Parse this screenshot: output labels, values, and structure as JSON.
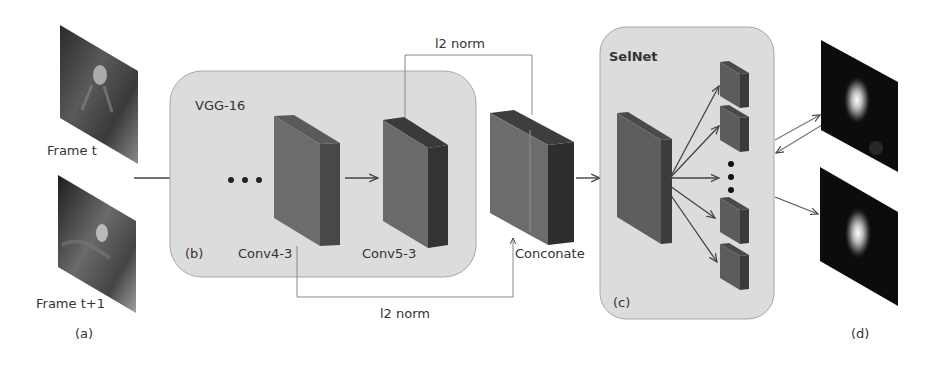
{
  "panels": {
    "a": {
      "label": "(a)",
      "frames": [
        {
          "label": "Frame t"
        },
        {
          "label": "Frame t+1"
        }
      ]
    },
    "b": {
      "title": "VGG-16",
      "label": "(b)",
      "ellipsis": "• • •",
      "layers": [
        {
          "label": "Conv4-3"
        },
        {
          "label": "Conv5-3"
        }
      ]
    },
    "concat": {
      "label": "Conconate",
      "top_connection_label": "l2 norm",
      "bottom_connection_label": "l2 norm"
    },
    "c": {
      "title": "SelNet",
      "label": "(c)",
      "output_blocks_visible": 4,
      "ellipsis": "⋮"
    },
    "d": {
      "label": "(d)",
      "maps": 2
    }
  },
  "colors": {
    "panel_fill": "#dcdcdc",
    "panel_border": "#a8a8a8",
    "block_front": "#6a6a6a",
    "block_side": "#3e3e3e",
    "block_top": "#555555",
    "arrow": "#444444",
    "text": "#333333"
  }
}
